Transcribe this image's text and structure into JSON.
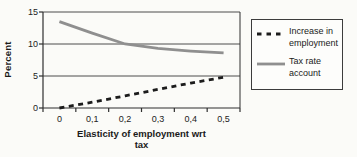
{
  "chart_data": {
    "type": "line",
    "categories": [
      "0",
      "0,1",
      "0,2",
      "0,3",
      "0,4",
      "0,5"
    ],
    "series": [
      {
        "name": "Increase in employment",
        "values": [
          0,
          0.9,
          1.9,
          2.9,
          3.9,
          4.8
        ],
        "color": "#1c1c1c",
        "style": "dashed"
      },
      {
        "name": "Tax rate account",
        "values": [
          13.5,
          11.7,
          10,
          9.3,
          8.9,
          8.6
        ],
        "color": "#8f8f8f",
        "style": "solid"
      }
    ],
    "xlabel": "Elasticity of employment wrt tax",
    "ylabel": "Percent",
    "ylim": [
      0,
      15
    ],
    "yticks": [
      0,
      5,
      10,
      15
    ],
    "grid": true,
    "legend_position": "right"
  },
  "colors": {
    "background": "#fbfbf8",
    "axis": "#2f2f2f",
    "gridline": "#4d4d4d",
    "legend_border": "#3c3c3c",
    "text": "#1a1a1a"
  }
}
